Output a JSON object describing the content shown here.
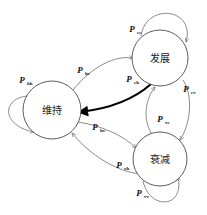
{
  "diagram": {
    "type": "state-transition-diagram",
    "title": "",
    "background_color": "#ffffff",
    "edge_color": "#6d6d6d",
    "highlight_edge_color": "#000000",
    "node_stroke_color": "#4a4a4a",
    "states": [
      {
        "id": "weichi",
        "label": "维持",
        "cx": 52,
        "cy": 110,
        "r": 29
      },
      {
        "id": "fazhan",
        "label": "发展",
        "cx": 160,
        "cy": 58,
        "r": 28
      },
      {
        "id": "shuaijian",
        "label": "衰减",
        "cx": 160,
        "cy": 159,
        "r": 27
      }
    ],
    "transitions": [
      {
        "id": "t-ee",
        "from": "fazhan",
        "to": "fazhan",
        "p": "P",
        "sub": "ee",
        "label_x": 132,
        "label_y": 32,
        "bold": false
      },
      {
        "id": "t-hh",
        "from": "weichi",
        "to": "weichi",
        "p": "P",
        "sub": "hh",
        "label_x": 22,
        "label_y": 83,
        "bold": false
      },
      {
        "id": "t-vv",
        "from": "shuaijian",
        "to": "shuaijian",
        "p": "P",
        "sub": "vv",
        "label_x": 139,
        "label_y": 196,
        "bold": false
      },
      {
        "id": "t-he",
        "from": "weichi",
        "to": "fazhan",
        "p": "P",
        "sub": "he",
        "label_x": 80,
        "label_y": 73,
        "bold": false
      },
      {
        "id": "t-eh",
        "from": "fazhan",
        "to": "weichi",
        "p": "P",
        "sub": "eh",
        "label_x": 129,
        "label_y": 82,
        "bold": true
      },
      {
        "id": "t-ev",
        "from": "fazhan",
        "to": "shuaijian",
        "p": "P",
        "sub": "ev",
        "label_x": 186,
        "label_y": 92,
        "bold": false
      },
      {
        "id": "t-ve",
        "from": "shuaijian",
        "to": "fazhan",
        "p": "P",
        "sub": "ve",
        "label_x": 160,
        "label_y": 122,
        "bold": false
      },
      {
        "id": "t-hv",
        "from": "weichi",
        "to": "shuaijian",
        "p": "P",
        "sub": "hv",
        "label_x": 95,
        "label_y": 130,
        "bold": false
      },
      {
        "id": "t-vh",
        "from": "shuaijian",
        "to": "weichi",
        "p": "P",
        "sub": "vh",
        "label_x": 119,
        "label_y": 168,
        "bold": false
      }
    ]
  }
}
